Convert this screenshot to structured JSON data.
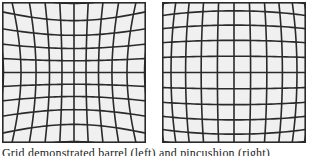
{
  "figure": {
    "panels": [
      {
        "id": "left",
        "label": "barrel distortion grid",
        "distortion": "barrel",
        "k": 0.22
      },
      {
        "id": "right",
        "label": "pincushion distortion grid",
        "distortion": "pincushion",
        "k": -0.18
      }
    ],
    "grid_lines": 11,
    "line_color": "#2a2a2a",
    "background_color": "#f0f0f0",
    "caption": "Grid demonstrated barrel (left) and pincushion (right)"
  }
}
